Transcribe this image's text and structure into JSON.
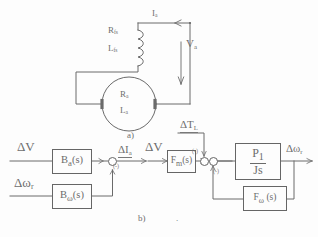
{
  "figure": {
    "caption_a": "a)",
    "caption_b": "b)",
    "stray_dot": "."
  },
  "circuit": {
    "name": "dc-machine-equivalent-circuit",
    "labels": {
      "field_resistance": "R",
      "field_resistance_sub": "fs",
      "field_inductance": "L",
      "field_inductance_sub": "fs",
      "armature_resistance": "R",
      "armature_resistance_sub": "a",
      "armature_inductance": "L",
      "armature_inductance_sub": "a",
      "current": "I",
      "current_sub": "a",
      "voltage": "V",
      "voltage_sub": "a"
    }
  },
  "block_diagram": {
    "name": "small-signal-block-diagram",
    "inputs": [
      {
        "id": "delta-v-left",
        "symbol": "ΔV",
        "sub": ""
      },
      {
        "id": "delta-omega-r",
        "symbol": "Δω",
        "sub": "r"
      },
      {
        "id": "delta-v-right",
        "symbol": "ΔV",
        "sub": ""
      },
      {
        "id": "delta-tl",
        "symbol": "ΔT",
        "sub": "L"
      }
    ],
    "blocks": [
      {
        "id": "block-ba",
        "symbol": "B",
        "sub": "a",
        "arg": "(s)"
      },
      {
        "id": "block-bw",
        "symbol": "B",
        "sub": "ω",
        "arg": "(s)"
      },
      {
        "id": "block-fm",
        "symbol": "F",
        "sub": "m",
        "arg": "(s)"
      },
      {
        "id": "block-fw",
        "symbol": "F",
        "sub": "ω",
        "arg": " (s)"
      }
    ],
    "gain_block": {
      "id": "block-p1-over-js",
      "numerator": "P",
      "numerator_sub": "1",
      "denominator": "Js"
    },
    "signals": [
      {
        "id": "delta-ia",
        "symbol": "ΔI",
        "sub": "a"
      },
      {
        "id": "delta-omega-out",
        "symbol": "Δω",
        "sub": "r"
      }
    ],
    "sum_signs": [
      "(-)",
      "(-)",
      "(-)"
    ]
  },
  "colors": {
    "ink": "#5e5e5e",
    "line": "#555555",
    "paper": "#fdfdfd"
  }
}
